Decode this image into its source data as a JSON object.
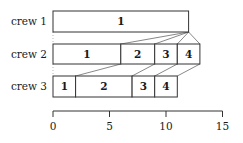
{
  "diagram": {
    "type": "gantt-pipeline",
    "scale": {
      "origin_px": 53,
      "px_per_unit": 11.3,
      "axis_y": 111
    },
    "crews": [
      {
        "label": "crew 1",
        "y_top": 11,
        "y_bottom": 32,
        "tasks": [
          {
            "label": "1",
            "start": 0,
            "end": 12
          }
        ]
      },
      {
        "label": "crew 2",
        "y_top": 44,
        "y_bottom": 64,
        "tasks": [
          {
            "label": "1",
            "start": 0,
            "end": 6
          },
          {
            "label": "2",
            "start": 6,
            "end": 9
          },
          {
            "label": "3",
            "start": 9,
            "end": 11
          },
          {
            "label": "4",
            "start": 11,
            "end": 13
          }
        ]
      },
      {
        "label": "crew 3",
        "y_top": 76,
        "y_bottom": 97,
        "tasks": [
          {
            "label": "1",
            "start": 0,
            "end": 2
          },
          {
            "label": "2",
            "start": 2,
            "end": 7
          },
          {
            "label": "3",
            "start": 7,
            "end": 9
          },
          {
            "label": "4",
            "start": 9,
            "end": 11
          }
        ]
      }
    ],
    "axis": {
      "ticks": [
        {
          "value": 0,
          "label": "0"
        },
        {
          "value": 5,
          "label": "5"
        },
        {
          "value": 10,
          "label": "10"
        },
        {
          "value": 15,
          "label": "15"
        }
      ]
    },
    "colors": {
      "stroke": "#333333",
      "fill": "#ffffff",
      "connector": "#555555"
    }
  }
}
